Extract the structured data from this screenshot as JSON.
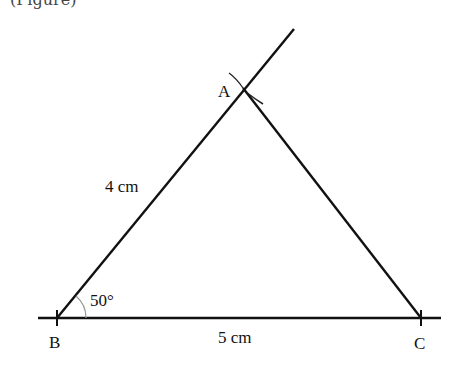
{
  "caption": "(Figure)",
  "diagram": {
    "type": "triangle-construction",
    "vertices": {
      "A": "A",
      "B": "B",
      "C": "C"
    },
    "side_labels": {
      "AB": "4 cm",
      "BC": "5 cm"
    },
    "angle_label": "50°",
    "angle_at": "B",
    "angle_degrees": 50,
    "side_lengths_cm": {
      "AB": 4,
      "BC": 5
    }
  }
}
